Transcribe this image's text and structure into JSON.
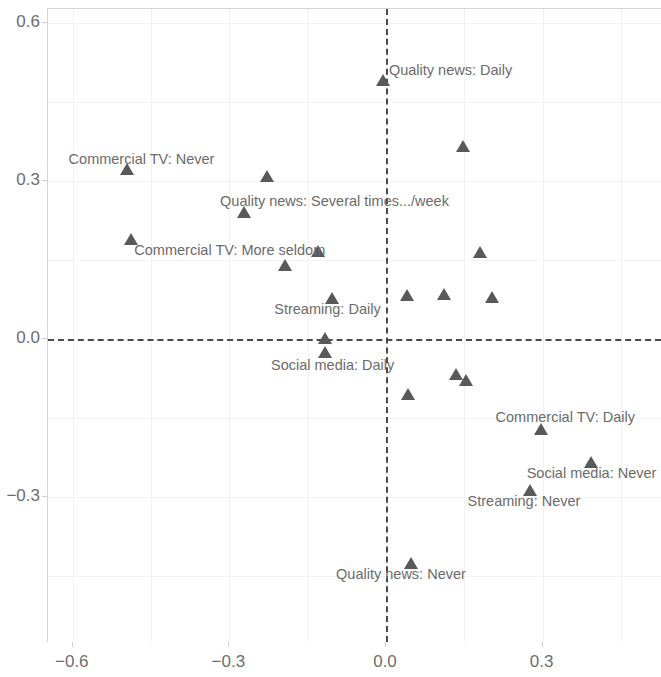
{
  "chart_data": {
    "type": "scatter",
    "title": "",
    "subtitle": "",
    "xlabel": "",
    "ylabel": "",
    "xlim": [
      -0.69,
      0.48
    ],
    "ylim": [
      -0.51,
      0.615
    ],
    "xticks": [
      -0.6,
      -0.3,
      0.0,
      0.3
    ],
    "xticklabels": [
      "−0.6",
      "−0.3",
      "0.0",
      "0.3"
    ],
    "yticks": [
      0.6,
      0.3,
      0.0,
      -0.3
    ],
    "yticklabels": [
      "0.6",
      "0.3",
      "0.0",
      "−0.3"
    ],
    "grid": true,
    "legend": "none",
    "marker": "triangle",
    "marker_color": "#59595c",
    "reference_lines": [
      {
        "orientation": "vertical",
        "value": 0.0,
        "style": "dashed",
        "color": "#4a4a4a"
      },
      {
        "orientation": "horizontal",
        "value": 0.0,
        "style": "dashed",
        "color": "#4a4a4a"
      }
    ],
    "points": [
      {
        "x": -0.495,
        "y": 0.32,
        "label": "Commercial TV: Never",
        "label_dx": -58,
        "label_dy": -18
      },
      {
        "x": -0.004,
        "y": 0.49,
        "label": "Quality news: Daily",
        "label_dx": 6,
        "label_dy": -18
      },
      {
        "x": 0.15,
        "y": 0.365,
        "label": "",
        "label_dx": 0,
        "label_dy": 0
      },
      {
        "x": -0.226,
        "y": 0.307,
        "label": "",
        "label_dx": 0,
        "label_dy": 0
      },
      {
        "x": -0.27,
        "y": 0.239,
        "label": "Quality news: Several times.../week",
        "label_dx": -24,
        "label_dy": -19
      },
      {
        "x": -0.486,
        "y": 0.188,
        "label": "",
        "label_dx": 0,
        "label_dy": 0
      },
      {
        "x": -0.128,
        "y": 0.165,
        "label": "",
        "label_dx": 0,
        "label_dy": 0
      },
      {
        "x": 0.182,
        "y": 0.163,
        "label": "",
        "label_dx": 0,
        "label_dy": 0
      },
      {
        "x": -0.191,
        "y": 0.139,
        "label": "Commercial TV: More seldom",
        "label_dx": -151,
        "label_dy": -23
      },
      {
        "x": -0.101,
        "y": 0.076,
        "label": "Streaming: Daily",
        "label_dx": -58,
        "label_dy": 3
      },
      {
        "x": 0.042,
        "y": 0.082,
        "label": "",
        "label_dx": 0,
        "label_dy": 0
      },
      {
        "x": 0.113,
        "y": 0.084,
        "label": "",
        "label_dx": 0,
        "label_dy": 0
      },
      {
        "x": 0.205,
        "y": 0.078,
        "label": "",
        "label_dx": 0,
        "label_dy": 0
      },
      {
        "x": -0.115,
        "y": 0.0,
        "label": "",
        "label_dx": 0,
        "label_dy": 0
      },
      {
        "x": -0.115,
        "y": -0.027,
        "label": "Social media: Daily",
        "label_dx": -54,
        "label_dy": 5
      },
      {
        "x": 0.136,
        "y": -0.068,
        "label": "",
        "label_dx": 0,
        "label_dy": 0
      },
      {
        "x": 0.155,
        "y": -0.08,
        "label": "",
        "label_dx": 0,
        "label_dy": 0
      },
      {
        "x": 0.044,
        "y": -0.106,
        "label": "",
        "label_dx": 0,
        "label_dy": 0
      },
      {
        "x": 0.298,
        "y": -0.173,
        "label": "Commercial TV: Daily",
        "label_dx": -45,
        "label_dy": -20
      },
      {
        "x": 0.394,
        "y": -0.235,
        "label": "Social media: Never",
        "label_dx": -64,
        "label_dy": 3
      },
      {
        "x": 0.277,
        "y": -0.289,
        "label": "Streaming: Never",
        "label_dx": -62,
        "label_dy": 3
      },
      {
        "x": 0.05,
        "y": -0.427,
        "label": "Quality news: Never",
        "label_dx": -75,
        "label_dy": 3
      }
    ]
  }
}
